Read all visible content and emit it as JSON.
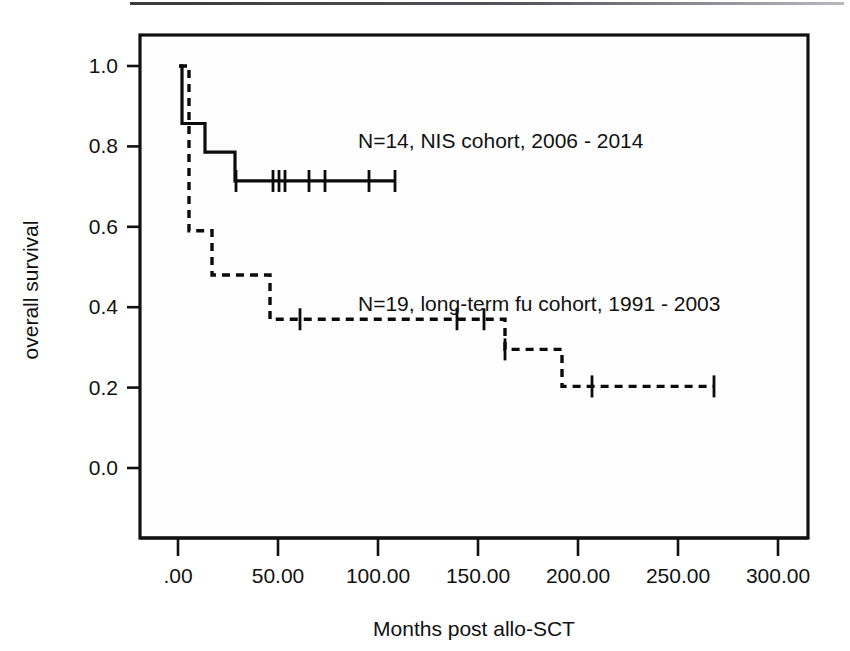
{
  "figure": {
    "background_color": "#ffffff",
    "ink_color": "#111111",
    "top_rule": true
  },
  "chart_data": {
    "type": "line",
    "subtype": "kaplan-meier-survival-step",
    "title": "",
    "xlabel": "Months post allo-SCT",
    "ylabel": "overall survival",
    "xlim": [
      0,
      300
    ],
    "ylim": [
      0.0,
      1.05
    ],
    "grid": false,
    "legend_position": "inline-annotation",
    "x_tick_values": [
      0,
      50,
      100,
      150,
      200,
      250,
      300
    ],
    "x_tick_labels": [
      ".00",
      "50.00",
      "100.00",
      "150.00",
      "200.00",
      "250.00",
      "300.00"
    ],
    "y_tick_values": [
      0.0,
      0.2,
      0.4,
      0.6,
      0.8,
      1.0
    ],
    "y_tick_labels": [
      "0.0",
      "0.2",
      "0.4",
      "0.6",
      "0.8",
      "1.0"
    ],
    "series": [
      {
        "name": "N=14, NIS cohort, 2006 - 2014",
        "style": "solid",
        "n": 14,
        "cohort": "NIS cohort",
        "period": "2006 - 2014",
        "steps": [
          {
            "x": 1.0,
            "y": 1.0
          },
          {
            "x": 2.0,
            "y": 0.857
          },
          {
            "x": 13.5,
            "y": 0.786
          },
          {
            "x": 28.5,
            "y": 0.714
          },
          {
            "x": 108.5,
            "y": 0.714
          }
        ],
        "censored_x": [
          29.0,
          47.5,
          50.5,
          53.5,
          65.5,
          73.5,
          95.5,
          108.5
        ],
        "censored_y": 0.714,
        "end_x": 108.5
      },
      {
        "name": "N=19, long-term fu cohort, 1991 - 2003",
        "style": "dashed",
        "n": 19,
        "cohort": "long-term fu cohort",
        "period": "1991 - 2003",
        "steps": [
          {
            "x": 0.5,
            "y": 1.0
          },
          {
            "x": 5.5,
            "y": 0.59
          },
          {
            "x": 17.0,
            "y": 0.48
          },
          {
            "x": 42.5,
            "y": 0.48
          },
          {
            "x": 46.0,
            "y": 0.37
          },
          {
            "x": 153.0,
            "y": 0.37
          },
          {
            "x": 163.5,
            "y": 0.295
          },
          {
            "x": 187.5,
            "y": 0.295
          },
          {
            "x": 192.0,
            "y": 0.203
          },
          {
            "x": 268.0,
            "y": 0.203
          }
        ],
        "censored": [
          {
            "x": 61.0,
            "y": 0.37
          },
          {
            "x": 139.5,
            "y": 0.37
          },
          {
            "x": 153.0,
            "y": 0.37
          },
          {
            "x": 163.5,
            "y": 0.295
          },
          {
            "x": 207.0,
            "y": 0.203
          },
          {
            "x": 268.0,
            "y": 0.203
          }
        ],
        "end_x": 268.0
      }
    ],
    "annotations": [
      {
        "text": "N=14, NIS cohort, 2006 - 2014",
        "x": 100,
        "y": 0.83
      },
      {
        "text": "N=19, long-term fu cohort, 1991 - 2003",
        "x": 118,
        "y": 0.455
      }
    ]
  }
}
